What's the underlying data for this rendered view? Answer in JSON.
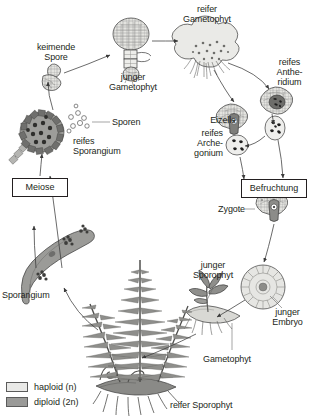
{
  "diagram": {
    "type": "life-cycle-diagram",
    "background_color": "#ffffff",
    "ink_color": "#231f20"
  },
  "labels": {
    "keimende_spore": "keimende\nSpore",
    "junger_gametophyt": "junger\nGametophyt",
    "reifer_gametophyt": "reifer\nGametophyt",
    "reifes_antheridium": "reifes\nAnthe-\nridium",
    "eizelle": "Eizelle",
    "reifes_archegonium": "reifes\nArche-\ngonium",
    "sporen": "Sporen",
    "reifes_sporangium": "reifes\nSporangium",
    "meiose": "Meiose",
    "befruchtung": "Befruchtung",
    "zygote": "Zygote",
    "sporangium": "Sporangium",
    "junger_sporophyt": "junger\nSporophyt",
    "junger_embryo": "junger\nEmbryo",
    "gametophyt": "Gametophyt",
    "reifer_sporophyt": "reifer Sporophyt"
  },
  "legend": {
    "items": [
      {
        "label": "haploid (n)",
        "color": "#e9e9e7",
        "phase": "haploid"
      },
      {
        "label": "diploid (2n)",
        "color": "#9a9a98",
        "phase": "diploid"
      }
    ]
  },
  "colors": {
    "haploid_fill": "#e9e9e7",
    "haploid_fill_mid": "#dcdcd8",
    "diploid_fill": "#9a9a98",
    "diploid_fill_dark": "#777775",
    "outline": "#3a3a3a",
    "label_text": "#231f20",
    "spore_fill": "#ffffff"
  },
  "stages": [
    {
      "name": "keimende Spore",
      "phase": "haploid"
    },
    {
      "name": "junger Gametophyt",
      "phase": "haploid"
    },
    {
      "name": "reifer Gametophyt",
      "phase": "haploid"
    },
    {
      "name": "reifes Antheridium",
      "phase": "haploid"
    },
    {
      "name": "reifes Archegonium",
      "phase": "haploid"
    },
    {
      "name": "Eizelle",
      "phase": "haploid"
    },
    {
      "name": "Befruchtung",
      "phase": "transition"
    },
    {
      "name": "Zygote",
      "phase": "diploid"
    },
    {
      "name": "junger Embryo",
      "phase": "diploid"
    },
    {
      "name": "junger Sporophyt",
      "phase": "diploid"
    },
    {
      "name": "reifer Sporophyt",
      "phase": "diploid"
    },
    {
      "name": "Sporangium",
      "phase": "diploid"
    },
    {
      "name": "Meiose",
      "phase": "transition"
    },
    {
      "name": "reifes Sporangium",
      "phase": "diploid"
    },
    {
      "name": "Sporen",
      "phase": "haploid"
    }
  ]
}
